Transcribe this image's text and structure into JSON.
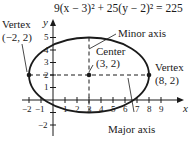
{
  "equation": "9(x − 3)² + 25(y − 2)² = 225",
  "axes": {
    "x_label": "x",
    "y_label": "y",
    "x_ticks": [
      "−2",
      "−1",
      "1",
      "2",
      "3",
      "4",
      "5",
      "6",
      "7",
      "8",
      "9"
    ],
    "y_ticks": [
      "−2",
      "1",
      "2",
      "3",
      "4",
      "5"
    ]
  },
  "annotations": {
    "vertex_left_title": "Vertex",
    "vertex_left_coords": "(−2, 2)",
    "vertex_right_title": "Vertex",
    "vertex_right_coords": "(8, 2)",
    "center_title": "Center",
    "center_coords": "(3, 2)",
    "minor_axis": "Minor axis",
    "major_axis": "Major axis"
  },
  "geometry": {
    "center": [
      3,
      2
    ],
    "semi_major": 5,
    "semi_minor": 3,
    "vertices": [
      [
        -2,
        2
      ],
      [
        8,
        2
      ]
    ]
  },
  "colors": {
    "ink": "#1a1a1a",
    "background": "#ffffff"
  }
}
